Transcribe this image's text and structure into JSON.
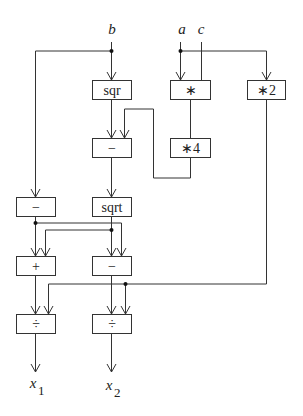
{
  "diagram": {
    "inputs": [
      {
        "id": "b",
        "label": "b"
      },
      {
        "id": "a",
        "label": "a"
      },
      {
        "id": "c",
        "label": "c"
      }
    ],
    "outputs": [
      {
        "id": "x1",
        "label": "x",
        "subscript": "1"
      },
      {
        "id": "x2",
        "label": "x",
        "subscript": "2"
      }
    ],
    "nodes": [
      {
        "id": "sqr",
        "label": "sqr"
      },
      {
        "id": "mul",
        "label": "∗"
      },
      {
        "id": "mul2",
        "label": "∗2"
      },
      {
        "id": "sub1",
        "label": "−"
      },
      {
        "id": "mul4",
        "label": "∗4"
      },
      {
        "id": "neg",
        "label": "−"
      },
      {
        "id": "sqrt",
        "label": "sqrt"
      },
      {
        "id": "add",
        "label": "+"
      },
      {
        "id": "sub2",
        "label": "−"
      },
      {
        "id": "div1",
        "label": "÷"
      },
      {
        "id": "div2",
        "label": "÷"
      }
    ],
    "edges": [
      [
        "b",
        "sqr"
      ],
      [
        "b",
        "neg"
      ],
      [
        "a",
        "mul"
      ],
      [
        "c",
        "mul"
      ],
      [
        "a",
        "mul2"
      ],
      [
        "sqr",
        "sub1"
      ],
      [
        "mul",
        "mul4"
      ],
      [
        "mul4",
        "sub1"
      ],
      [
        "sub1",
        "sqrt"
      ],
      [
        "neg",
        "add"
      ],
      [
        "neg",
        "sub2"
      ],
      [
        "sqrt",
        "add"
      ],
      [
        "sqrt",
        "sub2"
      ],
      [
        "add",
        "div1"
      ],
      [
        "mul2",
        "div1"
      ],
      [
        "sub2",
        "div2"
      ],
      [
        "mul2",
        "div2"
      ],
      [
        "div1",
        "x1"
      ],
      [
        "div2",
        "x2"
      ]
    ]
  }
}
